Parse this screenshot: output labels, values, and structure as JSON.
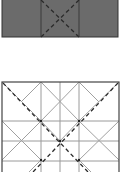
{
  "diagram": {
    "type": "crease-pattern",
    "colors": {
      "fill_top": "#6b6b6b",
      "outline": "#3a3a3a",
      "grid_line": "#9a9a9a",
      "fold_line": "#3a3a3a",
      "background": "#ffffff"
    },
    "top_panel": {
      "x": 2,
      "y": 0,
      "width": 116,
      "height": 37,
      "dividers_x": [
        41,
        79
      ],
      "dashed_x": {
        "from": [
          41,
          0
        ],
        "to": [
          79,
          37
        ],
        "from2": [
          79,
          0
        ],
        "to2": [
          41,
          37
        ]
      }
    },
    "bottom_panel": {
      "x": 2,
      "y": 82,
      "width": 117,
      "height": 95,
      "vertical_lines_x": [
        41,
        60,
        79
      ],
      "horizontal_lines_y": [
        121,
        141,
        161
      ],
      "dashed_diagonals": [
        {
          "from": [
            3,
            83
          ],
          "to": [
            80,
            172
          ]
        },
        {
          "from": [
            118,
            83
          ],
          "to": [
            41,
            172
          ]
        }
      ]
    }
  }
}
